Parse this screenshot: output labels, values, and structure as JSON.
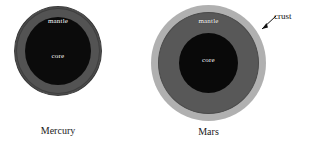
{
  "figure": {
    "background_color": "#ffffff"
  },
  "planets": [
    {
      "id": "mercury",
      "caption": "Mercury",
      "layers": [
        {
          "name": "mantle",
          "label": "mantle",
          "color": "#535353"
        },
        {
          "name": "core",
          "label": "core",
          "color": "#0b0b0b"
        }
      ]
    },
    {
      "id": "mars",
      "caption": "Mars",
      "layers": [
        {
          "name": "crust",
          "label": "crust",
          "color": "#b0b0b0"
        },
        {
          "name": "mantle",
          "label": "mantle",
          "color": "#585858"
        },
        {
          "name": "core",
          "label": "core",
          "color": "#090909"
        }
      ]
    }
  ],
  "annotations": {
    "crust_callout": {
      "label": "crust",
      "points_to": "mars-crust-layer",
      "arrow_color": "#111111"
    }
  }
}
